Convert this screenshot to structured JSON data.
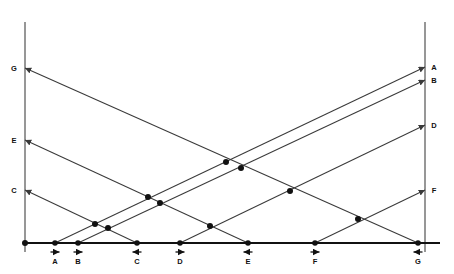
{
  "figure": {
    "type": "diagram",
    "title": "",
    "background_color": "#ffffff",
    "line_color": "#3a3a3a",
    "axis_color": "#6b6b6b",
    "baseline_color": "#111111",
    "dot_color": "#111111",
    "width": 454,
    "height": 274
  },
  "geometry": {
    "left_axis_x": 25,
    "right_axis_x": 425,
    "baseline_y": 243,
    "axis_top_y": 22,
    "axis_bottom_y": 252
  },
  "left_axis": {
    "name": "left-vertical-axis",
    "arrow_direction": "left",
    "labels": [
      {
        "text": "G",
        "y": 68,
        "label_x": 14
      },
      {
        "text": "E",
        "y": 140,
        "label_x": 14
      },
      {
        "text": "C",
        "y": 190,
        "label_x": 14
      }
    ]
  },
  "right_axis": {
    "name": "right-vertical-axis",
    "arrow_direction": "right",
    "labels": [
      {
        "text": "A",
        "y": 67,
        "label_x": 434
      },
      {
        "text": "B",
        "y": 80,
        "label_x": 434
      },
      {
        "text": "D",
        "y": 125,
        "label_x": 434
      },
      {
        "text": "F",
        "y": 190,
        "label_x": 434
      }
    ]
  },
  "baseline": {
    "name": "horizontal-baseline",
    "origin_x": 25,
    "end_x": 440,
    "points": [
      {
        "text": "A",
        "x": 55,
        "arrow": "right",
        "label_y": 259
      },
      {
        "text": "B",
        "x": 78,
        "arrow": "right",
        "label_y": 259
      },
      {
        "text": "C",
        "x": 137,
        "arrow": "left",
        "label_y": 259
      },
      {
        "text": "D",
        "x": 180,
        "arrow": "right",
        "label_y": 259
      },
      {
        "text": "E",
        "x": 248,
        "arrow": "left",
        "label_y": 259
      },
      {
        "text": "F",
        "x": 315,
        "arrow": "right",
        "label_y": 259
      },
      {
        "text": "G",
        "x": 418,
        "arrow": "left",
        "label_y": 259
      }
    ],
    "origin_dot": {
      "x": 25,
      "y": 243
    }
  },
  "rays": [
    {
      "id": "ray-A",
      "label": "A",
      "from_x": 55,
      "from_y": 243,
      "to_x": 425,
      "to_y": 67,
      "direction": "up-right"
    },
    {
      "id": "ray-B",
      "label": "B",
      "from_x": 78,
      "from_y": 243,
      "to_x": 425,
      "to_y": 80,
      "direction": "up-right"
    },
    {
      "id": "ray-D",
      "label": "D",
      "from_x": 180,
      "from_y": 243,
      "to_x": 425,
      "to_y": 125,
      "direction": "up-right"
    },
    {
      "id": "ray-F",
      "label": "F",
      "from_x": 315,
      "from_y": 243,
      "to_x": 425,
      "to_y": 190,
      "direction": "up-right"
    },
    {
      "id": "ray-C",
      "label": "C",
      "from_x": 137,
      "from_y": 243,
      "to_x": 25,
      "to_y": 190,
      "direction": "up-left"
    },
    {
      "id": "ray-E",
      "label": "E",
      "from_x": 248,
      "from_y": 243,
      "to_x": 25,
      "to_y": 140,
      "direction": "up-left"
    },
    {
      "id": "ray-G",
      "label": "G",
      "from_x": 418,
      "from_y": 243,
      "to_x": 25,
      "to_y": 68,
      "direction": "up-left"
    }
  ],
  "intersection_dots": [
    {
      "x": 95,
      "y": 224
    },
    {
      "x": 108,
      "y": 228
    },
    {
      "x": 148,
      "y": 197
    },
    {
      "x": 160,
      "y": 203
    },
    {
      "x": 210,
      "y": 226
    },
    {
      "x": 226,
      "y": 162
    },
    {
      "x": 241,
      "y": 168
    },
    {
      "x": 290,
      "y": 191
    },
    {
      "x": 358,
      "y": 219
    }
  ]
}
